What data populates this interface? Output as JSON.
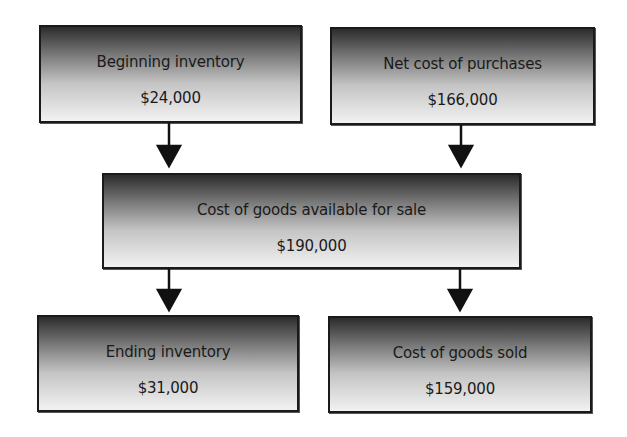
{
  "diagram": {
    "nodes": {
      "beginning_inventory": {
        "label": "Beginning inventory",
        "value": "$24,000"
      },
      "net_cost_of_purchases": {
        "label": "Net cost of purchases",
        "value": "$166,000"
      },
      "cost_of_goods_available": {
        "label": "Cost of goods available for sale",
        "value": "$190,000"
      },
      "ending_inventory": {
        "label": "Ending inventory",
        "value": "$31,000"
      },
      "cost_of_goods_sold": {
        "label": "Cost of goods sold",
        "value": "$159,000"
      }
    },
    "edges": [
      {
        "from": "beginning_inventory",
        "to": "cost_of_goods_available"
      },
      {
        "from": "net_cost_of_purchases",
        "to": "cost_of_goods_available"
      },
      {
        "from": "cost_of_goods_available",
        "to": "ending_inventory"
      },
      {
        "from": "cost_of_goods_available",
        "to": "cost_of_goods_sold"
      }
    ]
  }
}
